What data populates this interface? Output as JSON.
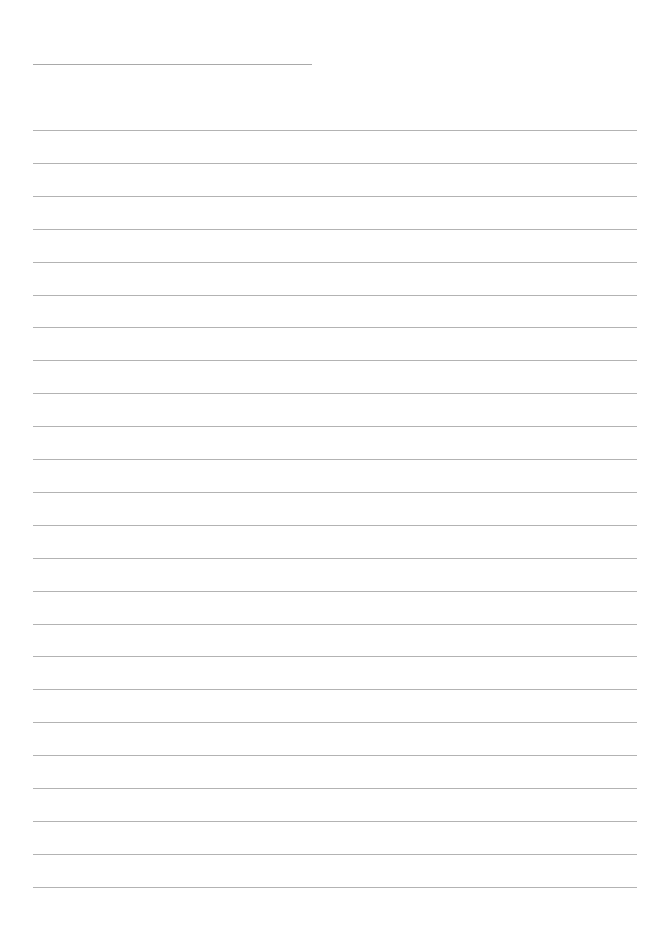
{
  "document": {
    "type": "lined-paper",
    "background_color": "#ffffff",
    "line_color": "#b3b3b3",
    "title_line": {
      "x": 33,
      "y": 64,
      "width": 279,
      "color": "#a9a9a9"
    },
    "ruled_lines": {
      "count": 24,
      "start_y": 130,
      "spacing": 32.9,
      "x": 33,
      "width": 604
    }
  }
}
